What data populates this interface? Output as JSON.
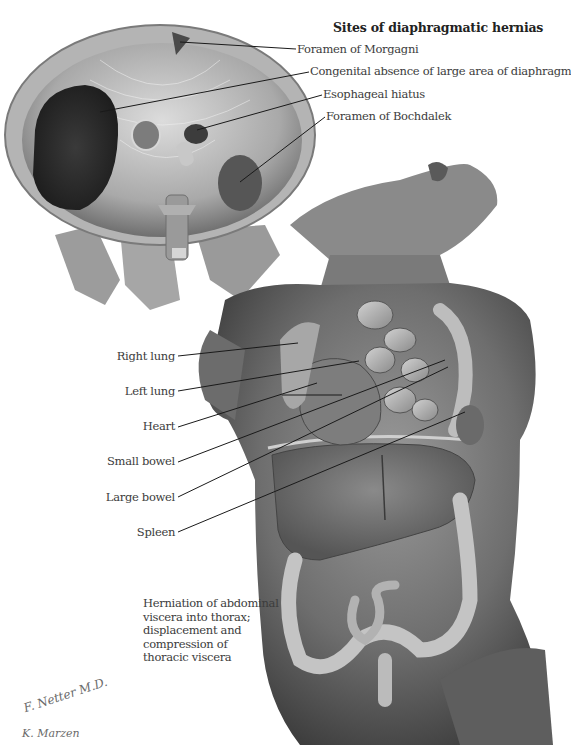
{
  "figure": {
    "title": "Sites of diaphragmatic hernias",
    "diaphragm_labels": [
      {
        "id": "foramen-of-morgagni",
        "text": "Foramen of Morgagni"
      },
      {
        "id": "congenital-absence",
        "text": "Congenital absence of large area of diaphragm"
      },
      {
        "id": "esophageal-hiatus",
        "text": "Esophageal hiatus"
      },
      {
        "id": "foramen-of-bochdalek",
        "text": "Foramen of Bochdalek"
      }
    ],
    "torso_labels": [
      {
        "id": "right-lung",
        "text": "Right lung"
      },
      {
        "id": "left-lung",
        "text": "Left lung"
      },
      {
        "id": "heart",
        "text": "Heart"
      },
      {
        "id": "small-bowel",
        "text": "Small bowel"
      },
      {
        "id": "large-bowel",
        "text": "Large bowel"
      },
      {
        "id": "spleen",
        "text": "Spleen"
      }
    ],
    "caption_lines": [
      "Herniation of abdominal",
      "viscera into thorax;",
      "displacement and",
      "compression of",
      "thoracic viscera"
    ],
    "signatures": {
      "artist": "F. Netter M.D.",
      "co_artist": "K. Marzen"
    },
    "colors": {
      "background": "#ffffff",
      "tissue_light": "#c8c8c8",
      "tissue_mid": "#8e8e8e",
      "tissue_dark": "#4a4a4a",
      "leader_line": "#1a1a1a",
      "text": "#3c3c3c"
    }
  }
}
